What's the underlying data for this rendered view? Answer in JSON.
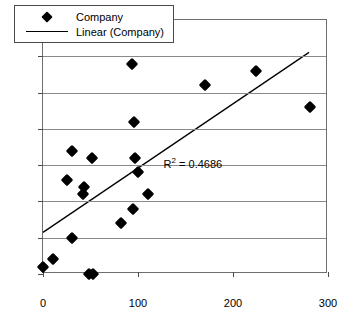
{
  "chart_data": {
    "type": "scatter",
    "title": "",
    "xlabel": "",
    "ylabel": "",
    "xlim": [
      0,
      300
    ],
    "ylim": [
      0,
      35
    ],
    "xticks": [
      0,
      100,
      200,
      300
    ],
    "yticks": [
      0,
      5,
      10,
      15,
      20,
      25,
      30,
      35
    ],
    "grid": "horizontal",
    "legend_position": "top-left",
    "series": [
      {
        "name": "Company",
        "marker": "diamond",
        "color": "#000000",
        "points": [
          [
            0,
            1
          ],
          [
            10,
            2
          ],
          [
            30,
            5
          ],
          [
            48,
            0
          ],
          [
            53,
            0
          ],
          [
            25,
            13
          ],
          [
            30,
            17
          ],
          [
            42,
            11
          ],
          [
            43,
            12
          ],
          [
            52,
            16
          ],
          [
            82,
            7
          ],
          [
            95,
            9
          ],
          [
            94,
            29
          ],
          [
            96,
            21
          ],
          [
            97,
            16
          ],
          [
            100,
            14
          ],
          [
            110,
            11
          ],
          [
            170,
            26
          ],
          [
            224,
            28
          ],
          [
            281,
            23
          ]
        ]
      },
      {
        "name": "Linear (Company)",
        "type": "trendline",
        "color": "#000000",
        "endpoints": [
          [
            0,
            5.5
          ],
          [
            282,
            30.5
          ]
        ],
        "annotation": "R2 = 0.4686"
      }
    ],
    "annotations": [
      {
        "text_prefix": "R",
        "text_sup": "2",
        "text_suffix": " = 0.4686",
        "x": 128,
        "y": 16.2
      }
    ]
  },
  "legend": {
    "items": [
      {
        "label": "Company",
        "key": "diamond-marker"
      },
      {
        "label": "Linear (Company)",
        "key": "line-marker"
      }
    ]
  },
  "axes": {
    "y_tick_labels": [
      "0",
      "5",
      "10",
      "15",
      "20",
      "25",
      "30",
      "35"
    ],
    "x_tick_labels": [
      "0",
      "100",
      "200",
      "300"
    ]
  },
  "annotation": {
    "r2_prefix": "R",
    "r2_sup": "2",
    "r2_value": " = 0.4686"
  }
}
